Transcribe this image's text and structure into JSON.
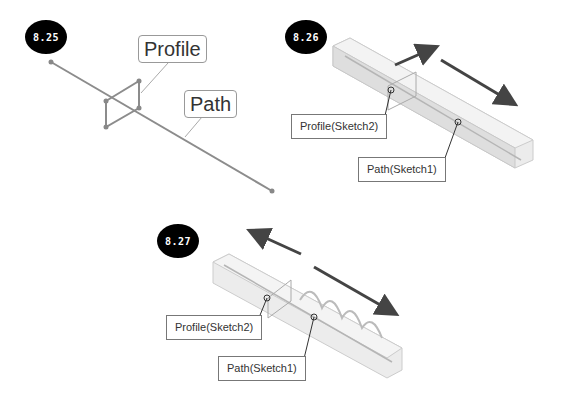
{
  "figures": [
    {
      "id": "fig-8-25",
      "badge": "8.25",
      "labels": {
        "profile": "Profile",
        "path": "Path"
      }
    },
    {
      "id": "fig-8-26",
      "badge": "8.26",
      "labels": {
        "profile": "Profile(Sketch2)",
        "path": "Path(Sketch1)"
      }
    },
    {
      "id": "fig-8-27",
      "badge": "8.27",
      "labels": {
        "profile": "Profile(Sketch2)",
        "path": "Path(Sketch1)"
      }
    }
  ],
  "colors": {
    "badge_bg": "#000000",
    "sketch_line": "#8c8c8c",
    "arrow": "#4a4a4a",
    "solid_fill": "#e4e4e4"
  }
}
